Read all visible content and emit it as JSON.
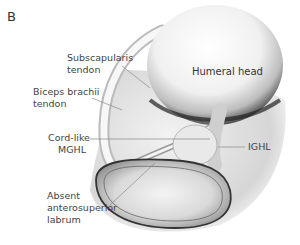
{
  "figure": {
    "panel_letter": "B",
    "labels": {
      "humeral_head": "Humeral head",
      "subscapularis_line1": "Subscapularis",
      "subscapularis_line2": "tendon",
      "biceps_line1": "Biceps brachii",
      "biceps_line2": "tendon",
      "mghl_line1": "Cord-like",
      "mghl_line2": "MGHL",
      "ighl": "IGHL",
      "labrum_line1": "Absent",
      "labrum_line2": "anterosuperior",
      "labrum_line3": "labrum"
    },
    "colors": {
      "background": "#ffffff",
      "text": "#444444",
      "leader_line": "#888888",
      "outline": "#333333"
    }
  }
}
